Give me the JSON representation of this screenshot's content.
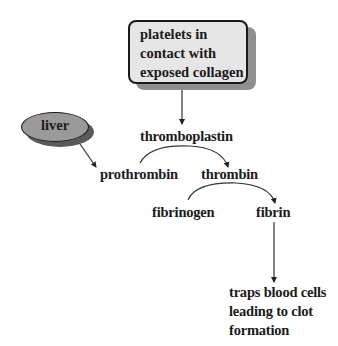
{
  "diagram": {
    "title": "",
    "nodes": {
      "platelets": {
        "lines": [
          "platelets in",
          "contact with",
          "exposed collagen"
        ],
        "shape": "rounded-box"
      },
      "liver": {
        "label": "liver",
        "shape": "ellipse"
      },
      "thromboplastin": {
        "label": "thromboplastin"
      },
      "prothrombin": {
        "label": "prothrombin"
      },
      "thrombin": {
        "label": "thrombin"
      },
      "fibrinogen": {
        "label": "fibrinogen"
      },
      "fibrin": {
        "label": "fibrin"
      },
      "outcome": {
        "lines": [
          "traps blood cells",
          "leading to clot",
          "formation"
        ]
      }
    },
    "edges": [
      {
        "from": "platelets",
        "to": "thromboplastin",
        "style": "straight"
      },
      {
        "from": "liver",
        "to": "prothrombin",
        "style": "straight"
      },
      {
        "from": "prothrombin",
        "to": "thrombin",
        "style": "curved",
        "catalyst": "thromboplastin"
      },
      {
        "from": "fibrinogen",
        "to": "fibrin",
        "style": "curved",
        "catalyst": "thrombin"
      },
      {
        "from": "fibrin",
        "to": "outcome",
        "style": "straight"
      }
    ],
    "colors": {
      "box_fill": "#e6e6e6",
      "box_shadow": "#8f8f8f",
      "ellipse_fill": "#9a9a9a",
      "ellipse_shadow": "#5a5a5a",
      "stroke": "#1a1a1a"
    }
  }
}
